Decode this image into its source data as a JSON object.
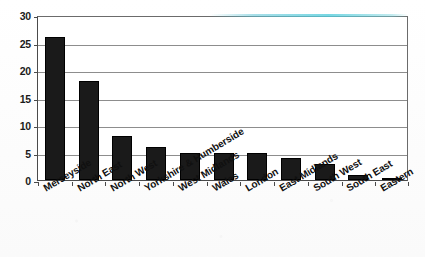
{
  "chart_data": {
    "type": "bar",
    "title": "",
    "subtitle": "",
    "xlabel": "",
    "ylabel": "",
    "categories": [
      "Merseyside",
      "North East",
      "North West",
      "Yorkshire & Humberside",
      "West Midlands",
      "Wales",
      "London",
      "East Midlands",
      "South West",
      "South East",
      "Eastern"
    ],
    "values": [
      26,
      18,
      8,
      6,
      5,
      5,
      5,
      4,
      3,
      1,
      0.4
    ],
    "ylim": [
      0,
      30
    ],
    "ytick_labels": [
      "0",
      "5",
      "10",
      "15",
      "20",
      "25",
      "30"
    ],
    "ytick_values": [
      0,
      5,
      10,
      15,
      20,
      25,
      30
    ],
    "grid": true,
    "grid_axis": "y",
    "legend": false,
    "legend_position": "none",
    "bar_color": "#1a1a1a",
    "axis_color": "#4a4a4a",
    "gridline_color": "#8d8d8d",
    "background_color": "#ffffff",
    "xtick_label_rotation": -31
  }
}
